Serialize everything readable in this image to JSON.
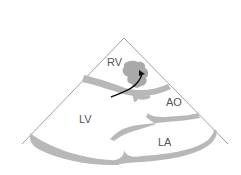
{
  "diagram": {
    "type": "echocardiogram-sector-schematic",
    "labels": {
      "rv": "RV",
      "lv": "LV",
      "ao": "AO",
      "la": "LA"
    },
    "colors": {
      "outline": "#8a8a8a",
      "tissue": "#b8b8b8",
      "mass": "#a9a9a9",
      "arrow": "#111111",
      "label": "#555555",
      "background": "#ffffff"
    }
  }
}
